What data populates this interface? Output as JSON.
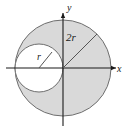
{
  "figure": {
    "background_color": "#ffffff",
    "shaded_fill": "#d9d9d9",
    "unshaded_fill": "#ffffff",
    "stroke_color": "#6e6e6e",
    "axis_color": "#1a1a1a",
    "label_color": "#1a1a1a"
  },
  "axes": {
    "x_label": "x",
    "y_label": "y",
    "origin": {
      "x": 63,
      "y": 68
    },
    "x_axis": {
      "x1": 6,
      "y1": 68,
      "x2": 116,
      "y2": 68
    },
    "y_axis": {
      "x1": 63,
      "y1": 13,
      "x2": 63,
      "y2": 126
    }
  },
  "shapes": {
    "outer_circle": {
      "name": "outer-circle",
      "center": {
        "x": 63,
        "y": 68
      },
      "radius": 48,
      "fill": "#d9d9d9",
      "radius_label": "2r"
    },
    "inner_circle": {
      "name": "inner-circle",
      "center": {
        "x": 39,
        "y": 68
      },
      "radius": 24,
      "fill": "#ffffff",
      "radius_label": "r"
    }
  },
  "radius_lines": {
    "outer": {
      "label": "2r",
      "from": {
        "x": 63,
        "y": 68
      },
      "to": {
        "x": 97,
        "y": 34
      },
      "label_position": {
        "x": 66,
        "y": 41
      }
    },
    "inner": {
      "label": "r",
      "from": {
        "x": 39,
        "y": 68
      },
      "to": {
        "x": 52,
        "y": 52
      },
      "label_position": {
        "x": 38,
        "y": 59
      }
    }
  }
}
